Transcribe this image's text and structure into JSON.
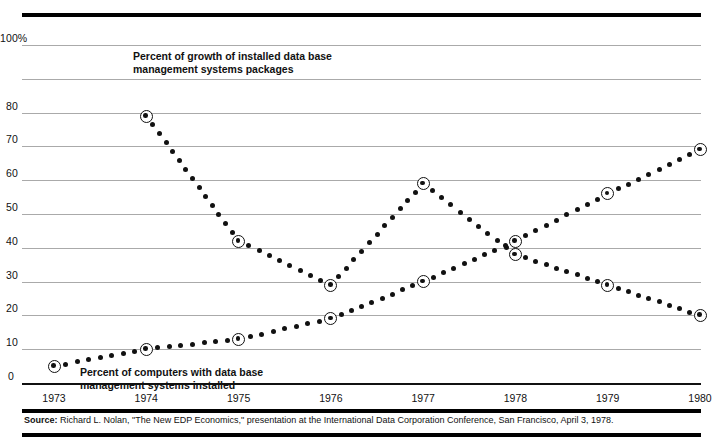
{
  "figure": {
    "source_prefix": "Source:",
    "source_text": " Richard L. Nolan, \"The New EDP Economics,\" presentation at the International Data Corporation Conference, San Francisco, April 3, 1978."
  },
  "chart_data": {
    "type": "line",
    "title": "",
    "subtitle": "",
    "xlabel": "",
    "ylabel": "",
    "grid": true,
    "legend_position": "inline-annotations",
    "x": [
      1973,
      1974,
      1975,
      1976,
      1977,
      1978,
      1979,
      1980
    ],
    "categories": [
      "1973",
      "1974",
      "1975",
      "1976",
      "1977",
      "1978",
      "1979",
      "1980"
    ],
    "xtick_labels": [
      "1973",
      "1974",
      "1975",
      "1976",
      "1977",
      "1978",
      "1979",
      "1980"
    ],
    "ytick_labels": [
      "100%",
      "80",
      "70",
      "60",
      "50",
      "40",
      "30",
      "20",
      "10",
      "0"
    ],
    "ytick_values": [
      100,
      80,
      70,
      60,
      50,
      40,
      30,
      20,
      10,
      0
    ],
    "gridline_values": [
      100,
      90,
      80,
      70,
      60,
      50,
      40,
      30,
      20,
      10,
      0
    ],
    "ylim": [
      0,
      100
    ],
    "series": [
      {
        "name": "Percent of growth of installed data base\nmanagement systems packages",
        "marker": "bullseye",
        "linestyle": "dotted",
        "color": "#111111",
        "x": [
          1974,
          1975,
          1976,
          1977,
          1978,
          1979,
          1980
        ],
        "values": [
          79,
          42,
          29,
          59,
          38,
          29,
          20
        ]
      },
      {
        "name": "Percent of computers with data base\nmanagement systems installed",
        "marker": "bullseye",
        "linestyle": "dotted",
        "color": "#111111",
        "x": [
          1973,
          1974,
          1975,
          1976,
          1977,
          1978,
          1979,
          1980
        ],
        "values": [
          5,
          10,
          13,
          19,
          30,
          42,
          56,
          69
        ]
      }
    ]
  }
}
